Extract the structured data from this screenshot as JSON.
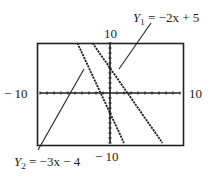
{
  "chart_data": {
    "type": "line",
    "title": "",
    "xlabel": "",
    "ylabel": "",
    "xlim": [
      -10,
      10
    ],
    "ylim": [
      -10,
      10
    ],
    "xscale_ticks": 1,
    "yscale_ticks": 1,
    "grid": false,
    "window_labels": {
      "xmin": "− 10",
      "xmax": "10",
      "ymin": "− 10",
      "ymax": "10"
    },
    "series": [
      {
        "name": "Y1",
        "equation": "Y1 = -2x + 5",
        "slope": -2,
        "intercept": 5,
        "style": "dotted",
        "annotation": {
          "label_var": "Y",
          "label_sub": "1",
          "label_rhs": " = −2x + 5",
          "position": "top-right"
        }
      },
      {
        "name": "Y2",
        "equation": "Y2 = -3x - 4",
        "slope": -3,
        "intercept": -4,
        "style": "dotted",
        "annotation": {
          "label_var": "Y",
          "label_sub": "2",
          "label_rhs": " = −3x − 4",
          "position": "bottom-left"
        }
      }
    ]
  }
}
